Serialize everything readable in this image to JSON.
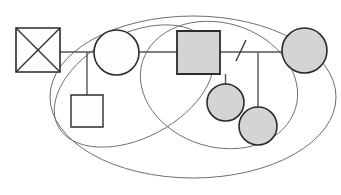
{
  "diagram": {
    "type": "genogram",
    "width": 341,
    "height": 195,
    "background_color": "#ffffff",
    "colors": {
      "node_stroke": "#2b2b2b",
      "shaded_fill": "#d4d4d4",
      "plain_fill": "#fdfdfd",
      "line_stroke": "#555555",
      "boundary_stroke": "#6e6e6e"
    },
    "nodes": [
      {
        "id": "n1",
        "data_name": "deceased-male-node",
        "shape": "square",
        "symbol": "square-with-x",
        "meaning": "deceased male",
        "fill": "plain",
        "x": 16,
        "y": 28,
        "width": 44,
        "height": 44
      },
      {
        "id": "n2",
        "data_name": "female-node-unshaded",
        "shape": "circle",
        "symbol": "circle",
        "meaning": "female",
        "fill": "plain",
        "cx": 116.5,
        "cy": 52.5,
        "r": 22.5
      },
      {
        "id": "n3",
        "data_name": "male-child-node-unshaded",
        "shape": "square",
        "symbol": "square",
        "meaning": "male child",
        "fill": "plain",
        "x": 71,
        "y": 95,
        "width": 32,
        "height": 32
      },
      {
        "id": "n4",
        "data_name": "male-node-shaded",
        "shape": "square",
        "symbol": "square",
        "meaning": "identified male",
        "fill": "shaded",
        "x": 177,
        "y": 31,
        "width": 43,
        "height": 43
      },
      {
        "id": "n5",
        "data_name": "female-node-shaded-right",
        "shape": "circle",
        "symbol": "circle",
        "meaning": "identified female",
        "fill": "shaded",
        "cx": 304.5,
        "cy": 50.5,
        "r": 22.5
      },
      {
        "id": "n6",
        "data_name": "female-child-node-shaded-upper",
        "shape": "circle",
        "symbol": "circle",
        "meaning": "female child",
        "fill": "shaded",
        "cx": 225.5,
        "cy": 102.5,
        "r": 18.5
      },
      {
        "id": "n7",
        "data_name": "female-child-node-shaded-lower",
        "shape": "circle",
        "symbol": "circle",
        "meaning": "female child",
        "fill": "shaded",
        "cx": 258,
        "cy": 126,
        "r": 19
      }
    ],
    "links": [
      {
        "id": "l1",
        "data_name": "relationship-line-horizontal",
        "meaning": "partnership line",
        "x1": 60,
        "y1": 52,
        "x2": 282,
        "y2": 52
      },
      {
        "id": "l2",
        "data_name": "descent-line-to-male-child",
        "meaning": "child link",
        "x1": 87,
        "y1": 52,
        "x2": 87,
        "y2": 95
      },
      {
        "id": "l3",
        "data_name": "descent-line-to-female-child-upper",
        "meaning": "child link",
        "x1": 225.5,
        "y1": 74,
        "x2": 225.5,
        "y2": 84
      },
      {
        "id": "l4",
        "data_name": "descent-line-to-female-child-lower",
        "meaning": "child link",
        "x1": 258,
        "y1": 52,
        "x2": 258,
        "y2": 107
      }
    ],
    "separation_mark": {
      "data_name": "separation-slash",
      "meaning": "separation / divorce slash",
      "x1": 246,
      "y1": 40,
      "x2": 236,
      "y2": 61
    },
    "boundaries": [
      {
        "id": "b1",
        "data_name": "household-boundary-outer",
        "meaning": "outer family boundary",
        "cx": 193,
        "cy": 97,
        "rx": 143,
        "ry": 81,
        "rotation": 0
      },
      {
        "id": "b2",
        "data_name": "subsystem-boundary-left",
        "meaning": "left subsystem boundary",
        "cx": 134,
        "cy": 86,
        "rx": 86,
        "ry": 52,
        "rotation": -28
      },
      {
        "id": "b3",
        "data_name": "subsystem-boundary-right",
        "meaning": "right subsystem boundary",
        "cx": 219,
        "cy": 85,
        "rx": 80,
        "ry": 62,
        "rotation": 17
      }
    ]
  }
}
